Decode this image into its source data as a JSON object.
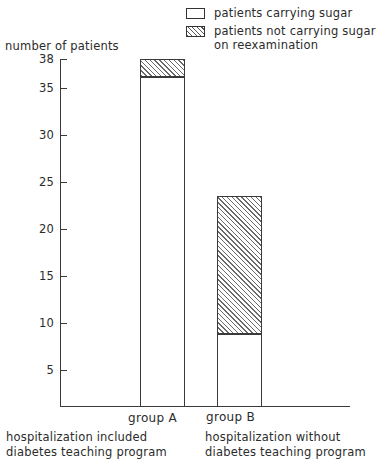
{
  "chart_data": {
    "type": "bar",
    "title": "",
    "subtitle": "",
    "ylabel": "number of patients",
    "xlabel": "",
    "stacked": true,
    "grid": false,
    "legend_position": "top-right",
    "ylim": [
      0,
      38
    ],
    "yticks": [
      5,
      10,
      15,
      20,
      25,
      30,
      35,
      38
    ],
    "ytick_labels": [
      "5",
      "10",
      "15",
      "20",
      "25",
      "30",
      "35",
      "38"
    ],
    "categories": [
      "group A",
      "group B"
    ],
    "category_captions": [
      [
        "hospitalization included",
        "diabetes teaching program"
      ],
      [
        "hospitalization without",
        "diabetes teaching program"
      ]
    ],
    "series": [
      {
        "name": "patients carrying sugar",
        "fill": "white",
        "values": [
          36,
          8
        ]
      },
      {
        "name": "patients not carrying sugar on reexamination",
        "fill": "hatched",
        "values": [
          2,
          15
        ]
      }
    ],
    "totals": [
      38,
      23
    ],
    "colors": {
      "line": "#3a3a3a",
      "white_fill": "#ffffff",
      "hatch_stroke": "#6a6a6a",
      "text": "#2b2b2b"
    }
  },
  "legend": {
    "items": [
      {
        "swatch": "white-swatch-icon",
        "line1": "patients carrying sugar",
        "line2": ""
      },
      {
        "swatch": "hatched-swatch-icon",
        "line1": "patients not  carrying sugar",
        "line2": "on reexamination"
      }
    ]
  },
  "axis": {
    "y_title": "number of patients",
    "y_tick_labels": [
      "38",
      "35",
      "30",
      "25",
      "20",
      "15",
      "10",
      "5"
    ]
  },
  "groups": [
    {
      "label": "group A",
      "caption_line1": "hospitalization included",
      "caption_line2": "diabetes teaching program"
    },
    {
      "label": "group B",
      "caption_line1": "hospitalization without",
      "caption_line2": "diabetes teaching program"
    }
  ]
}
